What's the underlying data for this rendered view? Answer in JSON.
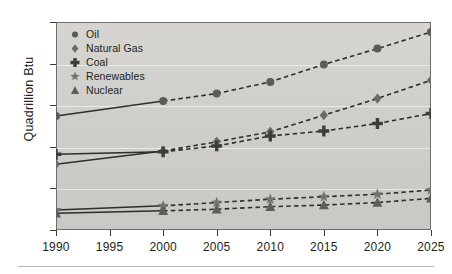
{
  "chart_data": {
    "type": "line",
    "title": "",
    "xlabel": "",
    "ylabel": "Quadrillion Btu",
    "xlim": [
      1990,
      2025
    ],
    "ylim": [
      0,
      250
    ],
    "grid": true,
    "legend_position": "top-left",
    "x": [
      1990,
      2000,
      2005,
      2010,
      2015,
      2020,
      2025
    ],
    "xticks": [
      "1990",
      "1995",
      "2000",
      "2005",
      "2010",
      "2015",
      "2020",
      "2025"
    ],
    "yticks": [
      "0",
      "50",
      "100",
      "150",
      "200",
      "250"
    ],
    "history_end": 2000,
    "note": "solid segments are history (1990-2000), dashed segments are projection (2000-2025)",
    "series": [
      {
        "name": "Oil",
        "marker": "circle",
        "color": "#5b5b59",
        "values": [
          137,
          155,
          164,
          178,
          199,
          218,
          238
        ]
      },
      {
        "name": "Natural Gas",
        "marker": "diamond",
        "color": "#6a6a68",
        "values": [
          79,
          95,
          106,
          118,
          138,
          158,
          180
        ]
      },
      {
        "name": "Coal",
        "marker": "plus",
        "color": "#3d3d3b",
        "values": [
          91,
          94,
          101,
          113,
          119,
          128,
          140
        ]
      },
      {
        "name": "Renewables",
        "marker": "star",
        "color": "#74746f",
        "values": [
          24,
          29,
          33,
          37,
          40,
          43,
          48
        ]
      },
      {
        "name": "Nuclear",
        "marker": "triangle",
        "color": "#5e5e5c",
        "values": [
          20,
          23,
          25,
          28,
          30,
          33,
          38
        ]
      }
    ]
  },
  "legend": {
    "items": [
      {
        "label": "Oil",
        "marker": "circle-marker-icon"
      },
      {
        "label": "Natural Gas",
        "marker": "diamond-marker-icon"
      },
      {
        "label": "Coal",
        "marker": "plus-marker-icon"
      },
      {
        "label": "Renewables",
        "marker": "star-marker-icon"
      },
      {
        "label": "Nuclear",
        "marker": "triangle-marker-icon"
      }
    ]
  },
  "colors": {
    "plot_background": "#cfcecb",
    "plot_border": "#6d6d6b",
    "gridline": "#ffffff",
    "text": "#231f20",
    "rule": "#b9b9b7"
  }
}
